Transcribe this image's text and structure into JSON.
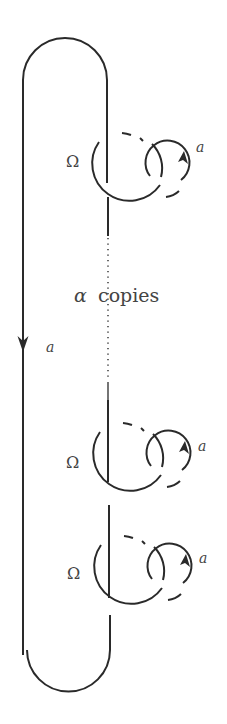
{
  "diagram": {
    "title": "",
    "labels": {
      "omega": "Ω",
      "strand_label": "a",
      "loop_label": "a",
      "copies_alpha": "α",
      "copies_word": "copies"
    },
    "copies": [
      {
        "name": "copy-1",
        "omega": "Ω",
        "loop_label": "a"
      },
      {
        "name": "copy-2",
        "omega": "Ω",
        "loop_label": "a"
      },
      {
        "name": "copy-3",
        "omega": "Ω",
        "loop_label": "a"
      }
    ],
    "colors": {
      "ink": "#2a2a2a",
      "text": "#444444",
      "background": "#ffffff"
    }
  }
}
